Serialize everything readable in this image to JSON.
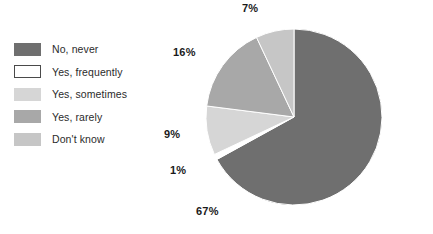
{
  "chart_data": {
    "type": "pie",
    "title": "",
    "legend_position": "left",
    "categories": [
      "No, never",
      "Yes, frequently",
      "Yes, sometimes",
      "Yes, rarely",
      "Don't know"
    ],
    "values": [
      67,
      1,
      9,
      16,
      7
    ],
    "value_labels": [
      "67%",
      "1%",
      "9%",
      "16%",
      "7%"
    ],
    "unit": "%",
    "colors": [
      "#6f6f6f",
      "#ffffff",
      "#d6d6d6",
      "#a8a8a8",
      "#c6c6c6"
    ],
    "slices": [
      {
        "label": "No, never",
        "value": 67,
        "display": "67%",
        "color": "#6f6f6f",
        "swatch_style": "filled"
      },
      {
        "label": "Yes, frequently",
        "value": 1,
        "display": "1%",
        "color": "#ffffff",
        "swatch_style": "outlined"
      },
      {
        "label": "Yes, sometimes",
        "value": 9,
        "display": "9%",
        "color": "#d6d6d6",
        "swatch_style": "filled"
      },
      {
        "label": "Yes, rarely",
        "value": 16,
        "display": "16%",
        "color": "#a8a8a8",
        "swatch_style": "filled"
      },
      {
        "label": "Don't know",
        "value": 7,
        "display": "7%",
        "color": "#c6c6c6",
        "swatch_style": "filled"
      }
    ]
  },
  "legend": {
    "items": [
      {
        "label": "No, never"
      },
      {
        "label": "Yes, frequently"
      },
      {
        "label": "Yes, sometimes"
      },
      {
        "label": "Yes, rarely"
      },
      {
        "label": "Don't know"
      }
    ]
  },
  "labels": {
    "top": "7%",
    "upper_left": "16%",
    "left": "9%",
    "lower_left": "1%",
    "bottom": "67%"
  }
}
